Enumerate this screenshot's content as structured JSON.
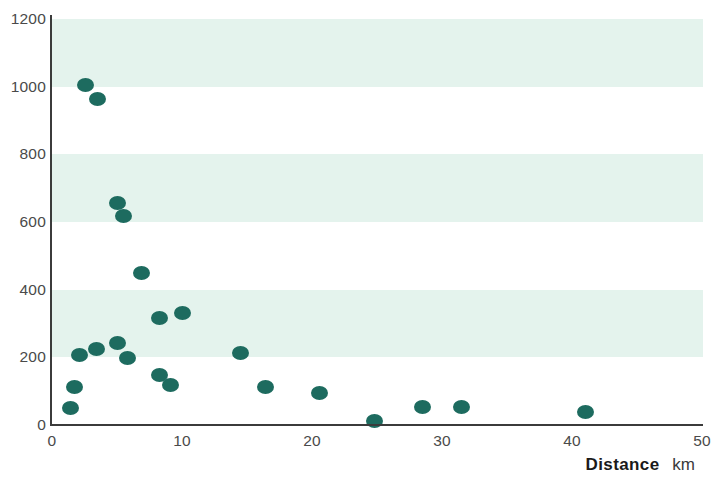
{
  "chart_data": {
    "type": "scatter",
    "title": "",
    "subtitle": "",
    "xlabel": "Distance",
    "xunit": "km",
    "ylabel": "",
    "xlim": [
      0,
      50
    ],
    "ylim": [
      0,
      1200
    ],
    "xticks": [
      0,
      10,
      20,
      30,
      40,
      50
    ],
    "yticks": [
      0,
      200,
      400,
      600,
      800,
      1000,
      1200
    ],
    "grid": false,
    "banded_background": true,
    "band_ranges": [
      [
        1000,
        1200
      ],
      [
        600,
        800
      ],
      [
        200,
        400
      ]
    ],
    "legend": null,
    "annotations": [],
    "marker_color": "#1d6b5f",
    "band_color": "#e2f2ec",
    "axis_color": "#3b3b3b",
    "tick_label_color": "#4a4a4a",
    "points": [
      {
        "x": 1.4,
        "y": 50
      },
      {
        "x": 1.7,
        "y": 112
      },
      {
        "x": 2.1,
        "y": 207
      },
      {
        "x": 2.6,
        "y": 1006
      },
      {
        "x": 3.4,
        "y": 225
      },
      {
        "x": 3.5,
        "y": 965
      },
      {
        "x": 5.0,
        "y": 243
      },
      {
        "x": 5.0,
        "y": 657
      },
      {
        "x": 5.5,
        "y": 618
      },
      {
        "x": 5.8,
        "y": 198
      },
      {
        "x": 6.9,
        "y": 450
      },
      {
        "x": 8.3,
        "y": 148
      },
      {
        "x": 8.3,
        "y": 317
      },
      {
        "x": 9.1,
        "y": 118
      },
      {
        "x": 10.0,
        "y": 331
      },
      {
        "x": 14.5,
        "y": 213
      },
      {
        "x": 16.4,
        "y": 112
      },
      {
        "x": 20.6,
        "y": 95
      },
      {
        "x": 24.8,
        "y": 12
      },
      {
        "x": 28.5,
        "y": 53
      },
      {
        "x": 31.5,
        "y": 53
      },
      {
        "x": 41.0,
        "y": 38
      }
    ]
  }
}
